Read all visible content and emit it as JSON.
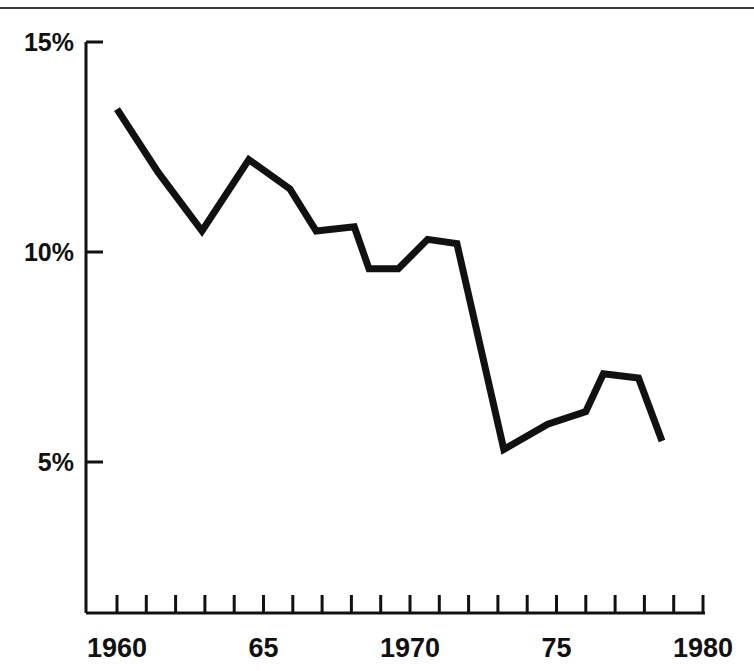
{
  "page": {
    "background_color": "#ffffff",
    "ink_color": "#111111",
    "rule_color": "#3a3a3a"
  },
  "chart_data": {
    "type": "line",
    "title": "",
    "subtitle": "",
    "xlabel": "",
    "ylabel": "",
    "xlim": [
      1960,
      1980
    ],
    "ylim": [
      5,
      15
    ],
    "grid": false,
    "legend": "none",
    "line_color": "#111111",
    "line_width": 7,
    "y_tick_labels": [
      "15%",
      "10%",
      "5%"
    ],
    "y_tick_values": [
      15,
      10,
      5
    ],
    "x_tick_labels": [
      "1960",
      "65",
      "1970",
      "75",
      "1980"
    ],
    "x_tick_values": [
      1960,
      1965,
      1970,
      1975,
      1980
    ],
    "x_minor_tick_values": [
      1960,
      1961,
      1962,
      1963,
      1964,
      1965,
      1966,
      1967,
      1968,
      1969,
      1970,
      1971,
      1972,
      1973,
      1974,
      1975,
      1976,
      1977,
      1978,
      1979,
      1980
    ],
    "series": [
      {
        "name": "rate",
        "x": [
          1960,
          1961.4,
          1962.9,
          1964.5,
          1965.9,
          1966.8,
          1968.1,
          1968.6,
          1969.6,
          1970.6,
          1971.6,
          1973.2,
          1974.7,
          1976.0,
          1976.6,
          1977.8,
          1978.6
        ],
        "values": [
          13.4,
          11.9,
          10.5,
          12.2,
          11.5,
          10.5,
          10.6,
          9.6,
          9.6,
          10.3,
          10.2,
          5.3,
          5.9,
          6.2,
          7.1,
          7.0,
          5.5
        ]
      }
    ]
  }
}
